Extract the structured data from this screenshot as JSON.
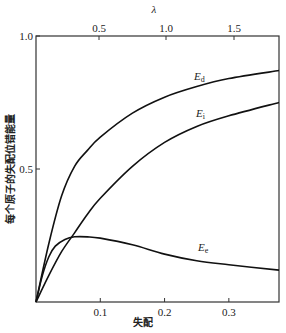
{
  "chart_data": {
    "type": "line",
    "title": "",
    "xlabel": "失配",
    "ylabel": "每个原子的失配位错能量",
    "top_xlabel": "λ",
    "xlim": [
      0,
      0.378
    ],
    "ylim": [
      0,
      1.0
    ],
    "x_ticks": [
      "0.1",
      "0.2",
      "0.3"
    ],
    "x_tick_values": [
      0.1,
      0.2,
      0.3
    ],
    "top_x_ticks": [
      "0.5",
      "1.0",
      "1.5"
    ],
    "y_ticks": [
      "0.5",
      "1.0"
    ],
    "y_tick_values": [
      0.5,
      1.0
    ],
    "grid": false,
    "legend": "inline labels",
    "series": [
      {
        "name": "E_d",
        "label_main": "E",
        "label_sub": "d",
        "x": [
          0,
          0.02,
          0.04,
          0.06,
          0.08,
          0.1,
          0.15,
          0.2,
          0.25,
          0.3,
          0.378
        ],
        "values": [
          0,
          0.22,
          0.4,
          0.51,
          0.57,
          0.62,
          0.71,
          0.77,
          0.81,
          0.84,
          0.87
        ]
      },
      {
        "name": "E_i",
        "label_main": "E",
        "label_sub": "i",
        "x": [
          0,
          0.02,
          0.04,
          0.06,
          0.08,
          0.1,
          0.15,
          0.2,
          0.25,
          0.3,
          0.378
        ],
        "values": [
          0,
          0.1,
          0.19,
          0.26,
          0.33,
          0.39,
          0.51,
          0.6,
          0.66,
          0.7,
          0.75
        ]
      },
      {
        "name": "E_e",
        "label_main": "E",
        "label_sub": "e",
        "x": [
          0,
          0.01,
          0.02,
          0.03,
          0.045,
          0.06,
          0.08,
          0.1,
          0.15,
          0.2,
          0.25,
          0.3,
          0.378
        ],
        "values": [
          0,
          0.1,
          0.17,
          0.21,
          0.235,
          0.245,
          0.245,
          0.24,
          0.215,
          0.18,
          0.155,
          0.14,
          0.12
        ]
      }
    ]
  }
}
